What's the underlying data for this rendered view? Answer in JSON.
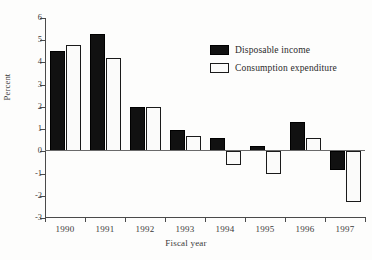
{
  "chart_data": {
    "type": "bar",
    "title": "",
    "xlabel": "Fiscal year",
    "ylabel": "Percent",
    "categories": [
      "1990",
      "1991",
      "1992",
      "1993",
      "1994",
      "1995",
      "1996",
      "1997"
    ],
    "series": [
      {
        "name": "Disposable income",
        "color": "#111111",
        "style": "filled",
        "values": [
          4.5,
          5.3,
          2.0,
          0.95,
          0.6,
          0.25,
          1.3,
          -0.85
        ]
      },
      {
        "name": "Consumption expenditure",
        "color": "#ffffff",
        "style": "outlined",
        "values": [
          4.8,
          4.2,
          2.0,
          0.7,
          -0.6,
          -1.0,
          0.6,
          -2.3
        ]
      }
    ],
    "ylim": [
      -3,
      6
    ],
    "ytick_values": [
      6,
      5,
      4,
      3,
      2,
      1,
      0,
      -1,
      -2,
      -3
    ],
    "ytick_labels": [
      "6",
      "5",
      "4",
      "3",
      "2",
      "1",
      "0",
      "-1",
      "-2",
      "-3"
    ],
    "grid": false,
    "zero_line": true,
    "legend_position": "upper right"
  },
  "legend": {
    "entries": [
      {
        "label": "Disposable income"
      },
      {
        "label": "Consumption expenditure"
      }
    ]
  }
}
